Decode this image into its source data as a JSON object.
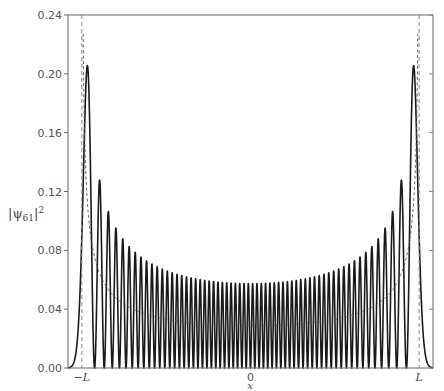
{
  "chart_data": {
    "type": "line",
    "title": "",
    "xlabel": "x",
    "ylabel": "|ψ61|²",
    "ylabel_parts": {
      "base": "|ψ",
      "sub": "61",
      "tail": "|",
      "sup": "2"
    },
    "xlim": [
      -12.0,
      12.0
    ],
    "ylim": [
      0.0,
      0.24
    ],
    "yticks": [
      0.0,
      0.04,
      0.08,
      0.12,
      0.16,
      0.2,
      0.24
    ],
    "ytick_labels": [
      "0.00",
      "0.04",
      "0.08",
      "0.12",
      "0.16",
      "0.20",
      "0.24"
    ],
    "xticks": [
      -11.09,
      0,
      11.09
    ],
    "xtick_labels": [
      "−L",
      "0",
      "L"
    ],
    "grid": false,
    "legend": null,
    "series": [
      {
        "name": "quantum probability density |ψ61(x)|²",
        "style": "solid",
        "color": "#1a1a1a",
        "quantum_number": 61,
        "num_peaks": 62,
        "peak_values_outer_to_inner_approx": [
          0.203,
          0.125,
          0.105,
          0.093,
          0.085,
          0.079,
          0.075,
          0.072,
          0.069,
          0.067
        ],
        "center_peak_value_approx": 0.057
      },
      {
        "name": "classical probability density",
        "style": "dashed",
        "color": "#555555",
        "formula": "1/(π·sqrt(L²−x²))",
        "value_at_zero_approx": 0.029
      }
    ],
    "vertical_lines": [
      {
        "x": -11.09,
        "label": "−L",
        "style": "dashed"
      },
      {
        "x": 11.09,
        "label": "L",
        "style": "dashed"
      }
    ],
    "turning_point_L": 11.09
  }
}
